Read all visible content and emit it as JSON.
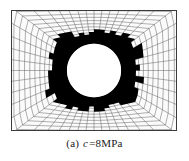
{
  "figure": {
    "caption_index": "(a)",
    "caption_symbol": "c",
    "caption_value": "=8MPa",
    "caption_full": "(a) c=8MPa",
    "frame_color": "#3a3a3a",
    "background_color": "#fbfbfb",
    "mesh_color": "#4a4a4a",
    "zone_color": "#000000",
    "hole_color": "#ffffff"
  },
  "chart_data": {
    "type": "heatmap",
    "title": "(a) c=8MPa",
    "subtitle": "",
    "xlabel": "",
    "ylabel": "",
    "grid": true,
    "legend_position": "none",
    "parameters": [
      {
        "name": "c",
        "value": 8,
        "unit": "MPa",
        "label": "c=8MPa"
      }
    ],
    "geometry": {
      "domain": {
        "x_range": [
          -1.0,
          1.0
        ],
        "y_range": [
          -0.73,
          0.73
        ]
      },
      "hole": {
        "center": [
          0.0,
          0.0
        ],
        "radius_x": 0.33,
        "radius_y": 0.45
      },
      "plastic_zone": {
        "center": [
          0.0,
          0.0
        ],
        "radius_x": 0.6,
        "radius_y": 0.8
      },
      "mesh": {
        "radial_divisions": 13,
        "circumferential_divisions": 48
      }
    },
    "annotations": [
      {
        "text": "(a) c=8MPa",
        "position": "below-figure"
      }
    ]
  }
}
